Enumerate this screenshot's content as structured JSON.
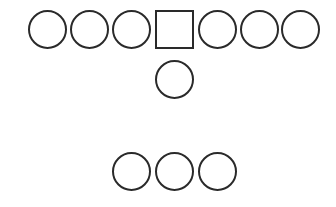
{
  "diagram": {
    "stroke_color": "#2a2a2a",
    "background_color": "#ffffff",
    "shape_size": 39,
    "rows": [
      {
        "name": "top-row",
        "y": 10,
        "shapes": [
          {
            "type": "circle",
            "x": 28
          },
          {
            "type": "circle",
            "x": 70
          },
          {
            "type": "circle",
            "x": 112
          },
          {
            "type": "square",
            "x": 155
          },
          {
            "type": "circle",
            "x": 198
          },
          {
            "type": "circle",
            "x": 240
          },
          {
            "type": "circle",
            "x": 281
          }
        ]
      },
      {
        "name": "middle-row",
        "y": 60,
        "shapes": [
          {
            "type": "circle",
            "x": 155
          }
        ]
      },
      {
        "name": "bottom-row",
        "y": 152,
        "shapes": [
          {
            "type": "circle",
            "x": 112
          },
          {
            "type": "circle",
            "x": 155
          },
          {
            "type": "circle",
            "x": 198
          }
        ]
      }
    ]
  }
}
